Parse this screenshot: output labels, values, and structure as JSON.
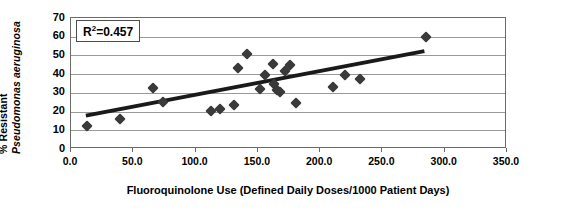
{
  "chart_data": {
    "type": "scatter",
    "title": "",
    "xlabel": "Fluoroquinolone Use (Defined Daily Doses/1000 Patient Days)",
    "ylabel_line1": "% Resistant",
    "ylabel_line2": "Pseudomonas aeruginosa",
    "xlim": [
      0,
      350
    ],
    "ylim": [
      0,
      70
    ],
    "xticks": [
      "0.0",
      "50.0",
      "100.0",
      "150.0",
      "200.0",
      "250.0",
      "300.0",
      "350.0"
    ],
    "xtick_values": [
      0,
      50,
      100,
      150,
      200,
      250,
      300,
      350
    ],
    "yticks": [
      "0",
      "10",
      "20",
      "30",
      "40",
      "50",
      "60",
      "70"
    ],
    "ytick_values": [
      0,
      10,
      20,
      30,
      40,
      50,
      60,
      70
    ],
    "grid": "horizontal",
    "legend": "none",
    "annotation": "R2=0.457",
    "annotation_label": "R",
    "annotation_sup": "2",
    "annotation_value": "=0.457",
    "r_squared": 0.457,
    "marker": "diamond",
    "marker_color": "#3a3a3a",
    "trendline": {
      "type": "linear",
      "x_start": 12,
      "y_start": 17,
      "x_end": 285,
      "y_end": 52,
      "color": "#1a1a1a",
      "width": 4
    },
    "points": [
      {
        "x": 13,
        "y": 12.5
      },
      {
        "x": 39,
        "y": 15.8
      },
      {
        "x": 66,
        "y": 32.5
      },
      {
        "x": 74,
        "y": 25.0
      },
      {
        "x": 112,
        "y": 20.5
      },
      {
        "x": 120,
        "y": 21.5
      },
      {
        "x": 131,
        "y": 23.3
      },
      {
        "x": 134,
        "y": 43.5
      },
      {
        "x": 141,
        "y": 50.7
      },
      {
        "x": 152,
        "y": 32.0
      },
      {
        "x": 156,
        "y": 39.5
      },
      {
        "x": 162,
        "y": 45.5
      },
      {
        "x": 163,
        "y": 35.0
      },
      {
        "x": 165,
        "y": 31.5
      },
      {
        "x": 168,
        "y": 30.5
      },
      {
        "x": 172,
        "y": 41.5
      },
      {
        "x": 176,
        "y": 45.0
      },
      {
        "x": 181,
        "y": 24.5
      },
      {
        "x": 210,
        "y": 33.0
      },
      {
        "x": 220,
        "y": 39.5
      },
      {
        "x": 232,
        "y": 37.5
      },
      {
        "x": 285,
        "y": 60.0
      }
    ]
  }
}
